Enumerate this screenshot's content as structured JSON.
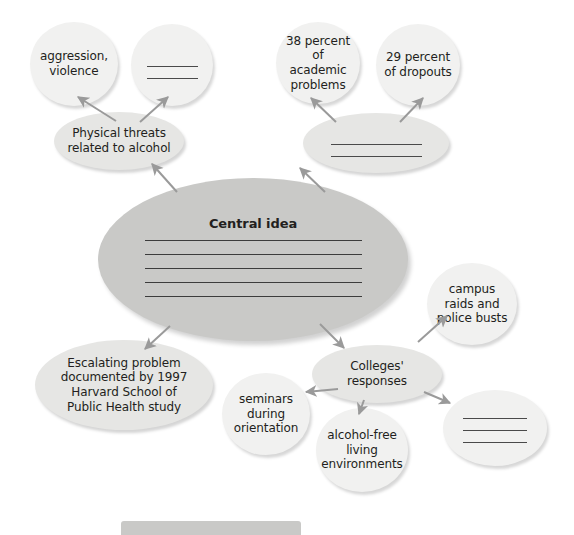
{
  "diagram": {
    "title": "Central idea",
    "nodes": [
      {
        "id": "aggression-violence",
        "text": "aggression,\nviolence",
        "tone": "light",
        "shape": "circle",
        "blank_lines": 0,
        "x": 30,
        "y": 22,
        "w": 88,
        "h": 84,
        "font_size": 12
      },
      {
        "id": "blank-effect-top",
        "text": "",
        "tone": "light",
        "shape": "circle",
        "blank_lines": 2,
        "x": 131,
        "y": 24,
        "w": 82,
        "h": 82,
        "font_size": 12
      },
      {
        "id": "academic-problems",
        "text": "38 percent\nof academic\nproblems",
        "tone": "light",
        "shape": "circle",
        "blank_lines": 0,
        "x": 276,
        "y": 22,
        "w": 84,
        "h": 82,
        "font_size": 12
      },
      {
        "id": "dropouts",
        "text": "29 percent\nof dropouts",
        "tone": "light",
        "shape": "circle",
        "blank_lines": 0,
        "x": 376,
        "y": 24,
        "w": 84,
        "h": 82,
        "font_size": 12
      },
      {
        "id": "physical-threats",
        "text": "Physical threats\nrelated to alcohol",
        "tone": "mid",
        "shape": "ellipse",
        "blank_lines": 0,
        "x": 54,
        "y": 112,
        "w": 130,
        "h": 58,
        "font_size": 12
      },
      {
        "id": "blank-cause-top-right",
        "text": "",
        "tone": "mid",
        "shape": "ellipse",
        "blank_lines": 2,
        "x": 303,
        "y": 113,
        "w": 146,
        "h": 60,
        "font_size": 12
      },
      {
        "id": "central-idea",
        "text": "Central idea",
        "tone": "dark",
        "shape": "ellipse",
        "blank_lines": 5,
        "x": 98,
        "y": 178,
        "w": 310,
        "h": 163,
        "font_size": 13
      },
      {
        "id": "campus-raids",
        "text": "campus\nraids and\npolice busts",
        "tone": "light",
        "shape": "circle",
        "blank_lines": 0,
        "x": 427,
        "y": 263,
        "w": 90,
        "h": 82,
        "font_size": 12
      },
      {
        "id": "escalating-problem",
        "text": "Escalating problem\ndocumented by 1997\nHarvard School of\nPublic Health study",
        "tone": "mid",
        "shape": "ellipse",
        "blank_lines": 0,
        "x": 35,
        "y": 340,
        "w": 178,
        "h": 90,
        "font_size": 12
      },
      {
        "id": "colleges-responses",
        "text": "Colleges'\nresponses",
        "tone": "mid",
        "shape": "ellipse",
        "blank_lines": 0,
        "x": 312,
        "y": 345,
        "w": 130,
        "h": 58,
        "font_size": 12
      },
      {
        "id": "seminars-orientation",
        "text": "seminars\nduring\norientation",
        "tone": "light",
        "shape": "circle",
        "blank_lines": 0,
        "x": 222,
        "y": 373,
        "w": 88,
        "h": 82,
        "font_size": 12
      },
      {
        "id": "alcohol-free-living",
        "text": "alcohol-free\nliving\nenvironments",
        "tone": "light",
        "shape": "circle",
        "blank_lines": 0,
        "x": 316,
        "y": 408,
        "w": 92,
        "h": 84,
        "font_size": 12
      },
      {
        "id": "blank-response",
        "text": "",
        "tone": "light",
        "shape": "ellipse",
        "blank_lines": 3,
        "x": 443,
        "y": 390,
        "w": 104,
        "h": 76,
        "font_size": 12
      }
    ],
    "arrows": [
      {
        "id": "physical-threats-to-aggression",
        "x1": 116,
        "y1": 121,
        "x2": 78,
        "y2": 97
      },
      {
        "id": "physical-threats-to-blank-effect",
        "x1": 140,
        "y1": 122,
        "x2": 168,
        "y2": 97
      },
      {
        "id": "central-to-physical-threats",
        "x1": 177,
        "y1": 192,
        "x2": 152,
        "y2": 164
      },
      {
        "id": "blank-cause-to-academic-problems",
        "x1": 336,
        "y1": 122,
        "x2": 311,
        "y2": 98
      },
      {
        "id": "blank-cause-to-dropouts",
        "x1": 400,
        "y1": 122,
        "x2": 423,
        "y2": 98
      },
      {
        "id": "central-to-blank-cause",
        "x1": 325,
        "y1": 192,
        "x2": 300,
        "y2": 168
      },
      {
        "id": "central-to-escalating-problem",
        "x1": 170,
        "y1": 326,
        "x2": 145,
        "y2": 349
      },
      {
        "id": "central-to-colleges-responses",
        "x1": 320,
        "y1": 324,
        "x2": 344,
        "y2": 348
      },
      {
        "id": "colleges-to-campus-raids",
        "x1": 418,
        "y1": 342,
        "x2": 447,
        "y2": 316
      },
      {
        "id": "colleges-to-seminars",
        "x1": 338,
        "y1": 389,
        "x2": 306,
        "y2": 392
      },
      {
        "id": "colleges-to-alcohol-free",
        "x1": 364,
        "y1": 400,
        "x2": 359,
        "y2": 414
      },
      {
        "id": "colleges-to-blank-response",
        "x1": 424,
        "y1": 392,
        "x2": 450,
        "y2": 403
      }
    ],
    "bottom_bar": {
      "x": 121,
      "y": 521,
      "w": 180,
      "h": 14
    },
    "colors": {
      "bubble_light": "#f1f1f0",
      "bubble_mid": "#e6e6e4",
      "bubble_dark": "#c9c9c7",
      "text": "#231f20",
      "rule_line": "#3c3c3c",
      "arrow": "#9a9a9a",
      "background": "#ffffff"
    }
  }
}
